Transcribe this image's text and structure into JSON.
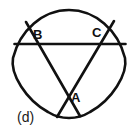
{
  "figure": {
    "panel_label": "(d)",
    "shape_name": "rounded-triangle",
    "stroke_color": "#111111",
    "background_color": "#ffffff",
    "labels": {
      "A": "A",
      "B": "B",
      "C": "C"
    },
    "label_positions": {
      "A": [
        71,
        91
      ],
      "B": [
        33,
        28
      ],
      "C": [
        92,
        26
      ],
      "panel": [
        17,
        110
      ]
    },
    "outline": {
      "type": "reuleaux-like-rounded-triangle",
      "apex_top": [
        69,
        10
      ],
      "vertex_left": [
        14,
        60
      ],
      "vertex_right": [
        125,
        60
      ],
      "apex_bottom": [
        69,
        118
      ]
    },
    "chords": [
      {
        "name": "horizontal-chord",
        "from": [
          14,
          44
        ],
        "to": [
          126,
          44
        ]
      },
      {
        "name": "chord-B-to-bottom-right",
        "from": [
          26,
          22
        ],
        "to": [
          80,
          116
        ]
      },
      {
        "name": "chord-C-to-bottom-left",
        "from": [
          114,
          21
        ],
        "to": [
          57,
          117
        ]
      }
    ],
    "intersections": {
      "B": [
        35,
        44
      ],
      "C": [
        94,
        44
      ],
      "A": [
        67,
        95
      ]
    }
  }
}
